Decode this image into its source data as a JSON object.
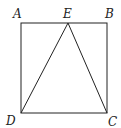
{
  "figure": {
    "type": "geometry",
    "stroke_color": "#222222",
    "points": {
      "A": {
        "label": "A",
        "x": 21,
        "y": 23
      },
      "B": {
        "label": "B",
        "x": 107,
        "y": 23
      },
      "C": {
        "label": "C",
        "x": 107,
        "y": 113
      },
      "D": {
        "label": "D",
        "x": 21,
        "y": 113
      },
      "E": {
        "label": "E",
        "x": 68,
        "y": 23
      }
    },
    "segments": [
      "AB",
      "BC",
      "CD",
      "DA",
      "DE",
      "EC"
    ]
  }
}
